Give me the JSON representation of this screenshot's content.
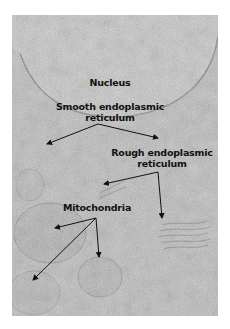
{
  "figure": {
    "type": "electron micrograph",
    "background_color": "#ffffff",
    "image_tone": "#b9b9b9",
    "labels": [
      {
        "id": "nucleus",
        "lines": [
          "Nucleus"
        ],
        "x": 110,
        "y": 77
      },
      {
        "id": "smooth-er",
        "lines": [
          "Smooth endoplasmic",
          "reticulum"
        ],
        "x": 110,
        "y": 101
      },
      {
        "id": "rough-er",
        "lines": [
          "Rough endoplasmic",
          "reticulum"
        ],
        "x": 162,
        "y": 147
      },
      {
        "id": "mitochondria",
        "lines": [
          "Mitochondria"
        ],
        "x": 97,
        "y": 202
      }
    ],
    "arrows": [
      {
        "label": "smooth-er",
        "from": [
          98,
          124
        ],
        "to": [
          47,
          144
        ]
      },
      {
        "label": "smooth-er",
        "from": [
          98,
          124
        ],
        "to": [
          158,
          138
        ]
      },
      {
        "label": "rough-er",
        "from": [
          158,
          172
        ],
        "to": [
          104,
          184
        ]
      },
      {
        "label": "rough-er",
        "from": [
          158,
          172
        ],
        "to": [
          162,
          218
        ]
      },
      {
        "label": "mitochondria",
        "from": [
          96,
          218
        ],
        "to": [
          55,
          228
        ]
      },
      {
        "label": "mitochondria",
        "from": [
          96,
          218
        ],
        "to": [
          33,
          280
        ]
      },
      {
        "label": "mitochondria",
        "from": [
          96,
          218
        ],
        "to": [
          99,
          257
        ]
      }
    ]
  }
}
